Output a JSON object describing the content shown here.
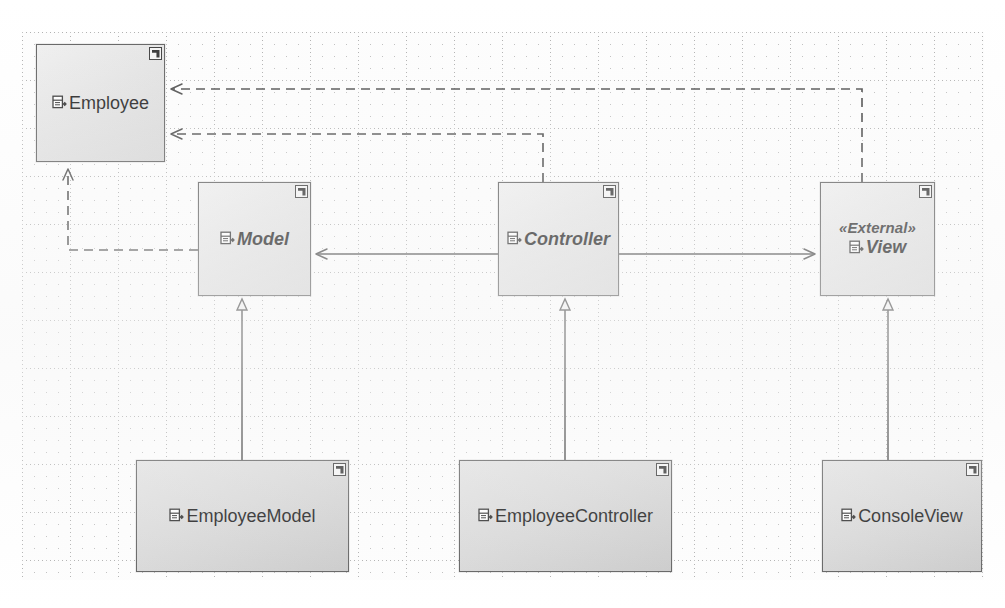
{
  "diagram": {
    "type": "uml-class-diagram",
    "background": "dotted-grid-paper",
    "colors": {
      "box_fill": "#e4e4e4",
      "box_border": "#5f5f5f",
      "line": "#4a4a4a",
      "text": "#1c1c1c"
    }
  },
  "classes": [
    {
      "id": "employee",
      "name": "Employee",
      "stereotype": "",
      "abstract": false,
      "icon": "uml-class-icon",
      "badge": "corner-badge-icon",
      "x": 36,
      "y": 44,
      "w": 129,
      "h": 118
    },
    {
      "id": "model",
      "name": "Model",
      "stereotype": "",
      "abstract": true,
      "icon": "uml-class-icon",
      "badge": "corner-badge-icon",
      "x": 198,
      "y": 182,
      "w": 113,
      "h": 114
    },
    {
      "id": "controller",
      "name": "Controller",
      "stereotype": "",
      "abstract": true,
      "icon": "uml-class-icon",
      "badge": "corner-badge-icon",
      "x": 498,
      "y": 182,
      "w": 121,
      "h": 114
    },
    {
      "id": "view",
      "name": "View",
      "stereotype": "«External»",
      "abstract": true,
      "icon": "uml-class-icon",
      "badge": "corner-badge-icon",
      "x": 820,
      "y": 182,
      "w": 115,
      "h": 114
    },
    {
      "id": "employeemodel",
      "name": "EmployeeModel",
      "stereotype": "",
      "abstract": false,
      "icon": "uml-class-icon",
      "badge": "corner-badge-icon",
      "x": 136,
      "y": 460,
      "w": 213,
      "h": 112
    },
    {
      "id": "employeecontroller",
      "name": "EmployeeController",
      "stereotype": "",
      "abstract": false,
      "icon": "uml-class-icon",
      "badge": "corner-badge-icon",
      "x": 459,
      "y": 460,
      "w": 213,
      "h": 112
    },
    {
      "id": "consoleview",
      "name": "ConsoleView",
      "stereotype": "",
      "abstract": false,
      "icon": "uml-class-icon",
      "badge": "corner-badge-icon",
      "x": 822,
      "y": 460,
      "w": 160,
      "h": 112
    }
  ],
  "relationships": [
    {
      "id": "gen-employeemodel-model",
      "kind": "generalization",
      "label": "",
      "from": "employeemodel",
      "to": "model",
      "style": "solid",
      "arrowhead": "hollow-triangle"
    },
    {
      "id": "gen-employeecontroller-controller",
      "kind": "generalization",
      "label": "",
      "from": "employeecontroller",
      "to": "controller",
      "style": "solid",
      "arrowhead": "hollow-triangle"
    },
    {
      "id": "gen-consoleview-view",
      "kind": "generalization",
      "label": "",
      "from": "consoleview",
      "to": "view",
      "style": "solid",
      "arrowhead": "hollow-triangle"
    },
    {
      "id": "assoc-controller-model",
      "kind": "association",
      "label": "",
      "from": "controller",
      "to": "model",
      "style": "solid",
      "arrowhead": "open-arrow"
    },
    {
      "id": "assoc-controller-view",
      "kind": "association",
      "label": "",
      "from": "controller",
      "to": "view",
      "style": "solid",
      "arrowhead": "open-arrow"
    },
    {
      "id": "dep-view-employee",
      "kind": "dependency",
      "label": "",
      "from": "view",
      "to": "employee",
      "style": "dashed",
      "arrowhead": "open-arrow"
    },
    {
      "id": "dep-controller-employee",
      "kind": "dependency",
      "label": "",
      "from": "controller",
      "to": "employee",
      "style": "dashed",
      "arrowhead": "open-arrow"
    },
    {
      "id": "dep-model-employee",
      "kind": "dependency",
      "label": "",
      "from": "model",
      "to": "employee",
      "style": "dashed",
      "arrowhead": "open-arrow"
    }
  ]
}
